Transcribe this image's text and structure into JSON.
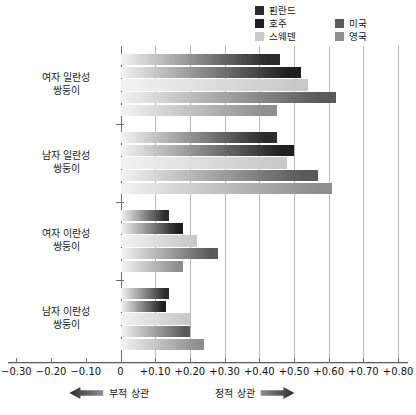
{
  "chart_data": {
    "type": "bar",
    "orientation": "horizontal",
    "title": "",
    "xlabel": "",
    "ylabel": "",
    "xlim": [
      -0.3,
      0.8
    ],
    "grid": true,
    "legend_position": "top-right",
    "categories": [
      "여자 일란성\n쌍둥이",
      "남자 일란성\n쌍둥이",
      "여자 이란성\n쌍둥이",
      "남자 이란성\n쌍둥이"
    ],
    "category_lines": [
      [
        "여자 일란성",
        "쌍둥이"
      ],
      [
        "남자 일란성",
        "쌍둥이"
      ],
      [
        "여자 이란성",
        "쌍둥이"
      ],
      [
        "남자 이란성",
        "쌍둥이"
      ]
    ],
    "series": [
      {
        "name": "핀란드",
        "color": "#2b2b2b",
        "values": [
          0.46,
          0.45,
          0.14,
          0.14
        ]
      },
      {
        "name": "호주",
        "color": "#1f1f1f",
        "values": [
          0.52,
          0.5,
          0.18,
          0.13
        ]
      },
      {
        "name": "스웨덴",
        "color": "#c9c9c9",
        "values": [
          0.54,
          0.48,
          0.22,
          0.2
        ]
      },
      {
        "name": "미국",
        "color": "#5a5a5a",
        "values": [
          0.62,
          0.57,
          0.28,
          0.2
        ]
      },
      {
        "name": "영국",
        "color": "#8e8e8e",
        "values": [
          0.45,
          0.61,
          0.18,
          0.24
        ]
      }
    ],
    "xticks": [
      -0.3,
      -0.2,
      -0.1,
      0,
      0.1,
      0.2,
      0.3,
      0.4,
      0.5,
      0.6,
      0.7,
      0.8
    ],
    "xtick_labels": [
      "−0.30",
      "−0.20",
      "−0.10",
      "0",
      "+0.10",
      "+0.20",
      "+0.30",
      "+0.40",
      "+0.50",
      "+0.60",
      "+0.70",
      "+0.80"
    ],
    "annotations": {
      "negative_label": "부적 상관",
      "positive_label": "정적 상관",
      "negative_arrow": "left-arrow-icon",
      "positive_arrow": "right-arrow-icon"
    }
  },
  "legend": {
    "column1": [
      {
        "label": "핀란드",
        "color": "#2b2b2b"
      },
      {
        "label": "호주",
        "color": "#1f1f1f"
      },
      {
        "label": "스웨덴",
        "color": "#c9c9c9"
      }
    ],
    "column2": [
      {
        "label": "미국",
        "color": "#5a5a5a"
      },
      {
        "label": "영국",
        "color": "#8e8e8e"
      }
    ]
  }
}
